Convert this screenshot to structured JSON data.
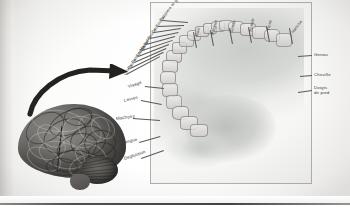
{
  "figure": {
    "top_caption": "",
    "brain_label": "",
    "panel_name": "homunculus-panel"
  },
  "colors": {
    "paper": "#fdfdfc",
    "cortex_gray": "#c9ccc9",
    "segment_fill": "#dedddb",
    "line": "#5a5957",
    "label_text": "#3a3a39",
    "brain_dark": "#4a4946",
    "arrow": "#232220"
  },
  "labels_top": [
    {
      "text": "Orteils",
      "angle": -62
    },
    {
      "text": "Pouce",
      "angle": -62
    },
    {
      "text": "Petit doigt",
      "angle": -62
    },
    {
      "text": "Annulaire",
      "angle": -62
    },
    {
      "text": "Majeur",
      "angle": -62
    },
    {
      "text": "Index",
      "angle": -62
    },
    {
      "text": "Pouce",
      "angle": -62
    },
    {
      "text": "Cou",
      "angle": -62
    },
    {
      "text": "Sourcil",
      "angle": -62
    },
    {
      "text": "Paupiere et globe oculaire",
      "angle": -62
    },
    {
      "text": "Main",
      "angle": -68
    },
    {
      "text": "Poignet",
      "angle": -72
    },
    {
      "text": "Coude",
      "angle": -78
    },
    {
      "text": "Epaule",
      "angle": -80
    },
    {
      "text": "Tronc",
      "angle": -80
    },
    {
      "text": "Hanche",
      "angle": -58
    }
  ],
  "labels_left": [
    {
      "text": "Visage"
    },
    {
      "text": "Levres"
    },
    {
      "text": "Machoire"
    },
    {
      "text": "Langue"
    },
    {
      "text": "Deglutition"
    }
  ],
  "labels_right": [
    {
      "text": "Genou"
    },
    {
      "text": "Cheville"
    },
    {
      "text": "Doigts de pied",
      "line1": "Doigts",
      "line2": "de pied"
    }
  ]
}
